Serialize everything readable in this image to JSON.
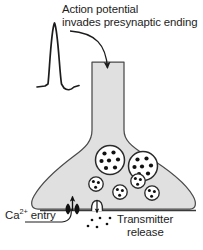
{
  "figure": {
    "width": 203,
    "height": 250,
    "background": "#ffffff"
  },
  "labels": {
    "action_potential": {
      "line1": "Action potential",
      "line2": "invades presynaptic ending"
    },
    "calcium_entry": {
      "prefix": "Ca",
      "superscript": "2+",
      "suffix": " entry"
    },
    "transmitter_release": {
      "line1": "Transmitter",
      "line2": "release"
    }
  },
  "colors": {
    "ink": "#1c1c1c",
    "terminal_fill": "#e0e0e0",
    "terminal_stroke": "#4a4a4a",
    "vesicle_fill": "#ffffff",
    "vesicle_stroke": "#2a2a2a",
    "granule": "#111111",
    "membrane": "#3a3a3a"
  },
  "shapes": {
    "axon": {
      "description": "vertical presynaptic axon shaft",
      "x": 92,
      "y": 62,
      "width": 32,
      "height": 70
    },
    "terminal": {
      "description": "bell-shaped presynaptic ending",
      "left": 27,
      "right": 195,
      "top": 132,
      "bottom": 210
    },
    "action_potential_trace": {
      "description": "spike waveform with afterhyperpolarization",
      "points": "38,86 43,84 47,82 50,26 55,22 59,26 63,82 66,88 70,89 75,85 79,84"
    },
    "curved_arrow": {
      "description": "arrow from text curving into axon",
      "from_x": 74,
      "from_y": 31,
      "to_x": 108,
      "to_y": 75
    },
    "large_vesicles": [
      {
        "cx": 110,
        "cy": 160,
        "r": 14,
        "granules": 7
      },
      {
        "cx": 143,
        "cy": 166,
        "r": 14,
        "granules": 7
      }
    ],
    "small_vesicles": [
      {
        "cx": 96,
        "cy": 184,
        "r": 7,
        "granules": 3
      },
      {
        "cx": 120,
        "cy": 192,
        "r": 7,
        "granules": 3
      },
      {
        "cx": 138,
        "cy": 181,
        "r": 7,
        "granules": 3
      },
      {
        "cx": 152,
        "cy": 193,
        "r": 7,
        "granules": 3
      }
    ],
    "calcium_channels": [
      {
        "cx": 68,
        "cy": 209
      },
      {
        "cx": 76,
        "cy": 209
      }
    ],
    "calcium_influx_arrow": {
      "x": 72,
      "y_top": 196,
      "y_bottom": 211
    },
    "fusion_pore": {
      "cx": 97,
      "cy": 209,
      "r": 6
    },
    "transmitter_efflux_arrow": {
      "x": 97,
      "y_top": 200,
      "y_bottom": 213
    },
    "released_transmitter_dots": [
      {
        "cx": 92,
        "cy": 220
      },
      {
        "cx": 100,
        "cy": 218
      },
      {
        "cx": 106,
        "cy": 224
      },
      {
        "cx": 97,
        "cy": 227
      },
      {
        "cx": 110,
        "cy": 218
      },
      {
        "cx": 88,
        "cy": 226
      }
    ],
    "cleft_line": {
      "x1": 40,
      "x2": 195,
      "y": 211
    }
  }
}
